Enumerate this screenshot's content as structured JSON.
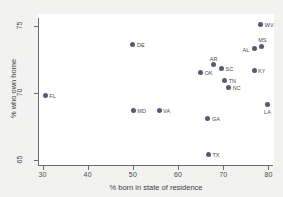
{
  "chart_data": {
    "type": "scatter",
    "title": "",
    "xlabel": "% born in state of residence",
    "ylabel": "% who own home",
    "xlim": [
      29,
      81
    ],
    "ylim": [
      64.6,
      75.6
    ],
    "xticks": [
      30,
      40,
      50,
      60,
      70,
      80
    ],
    "yticks": [
      65,
      70,
      75
    ],
    "grid": false,
    "legend": null,
    "points": [
      {
        "label": "WV",
        "x": 78.3,
        "y": 75.1,
        "label_pos": "right"
      },
      {
        "label": "MS",
        "x": 78.5,
        "y": 73.5,
        "label_pos": "above"
      },
      {
        "label": "AL",
        "x": 76.9,
        "y": 73.3,
        "label_pos": "left"
      },
      {
        "label": "DE",
        "x": 50.0,
        "y": 73.6,
        "label_pos": "right"
      },
      {
        "label": "AR",
        "x": 67.8,
        "y": 72.1,
        "label_pos": "above"
      },
      {
        "label": "SC",
        "x": 69.6,
        "y": 71.8,
        "label_pos": "right"
      },
      {
        "label": "KY",
        "x": 76.8,
        "y": 71.7,
        "label_pos": "right"
      },
      {
        "label": "OK",
        "x": 65.0,
        "y": 71.5,
        "label_pos": "right"
      },
      {
        "label": "TN",
        "x": 70.3,
        "y": 70.9,
        "label_pos": "right"
      },
      {
        "label": "NC",
        "x": 71.2,
        "y": 70.4,
        "label_pos": "right"
      },
      {
        "label": "FL",
        "x": 30.6,
        "y": 69.8,
        "label_pos": "right"
      },
      {
        "label": "LA",
        "x": 79.8,
        "y": 69.1,
        "label_pos": "below"
      },
      {
        "label": "MD",
        "x": 50.1,
        "y": 68.7,
        "label_pos": "right"
      },
      {
        "label": "VA",
        "x": 55.8,
        "y": 68.7,
        "label_pos": "right"
      },
      {
        "label": "GA",
        "x": 66.6,
        "y": 68.1,
        "label_pos": "right"
      },
      {
        "label": "TX",
        "x": 66.7,
        "y": 65.4,
        "label_pos": "right"
      }
    ]
  },
  "colors": {
    "point": "#555a78",
    "axis": "#6b6b6b",
    "text": "#4a4a4a",
    "plot_background": "#ffffff",
    "figure_background": "#f2f2f1"
  }
}
